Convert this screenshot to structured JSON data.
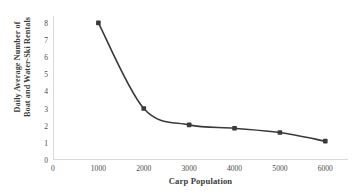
{
  "chart_data": {
    "type": "line",
    "title": "",
    "xlabel": "Carp Population",
    "ylabel": "Daily Average Number of Boat and Water-Ski Rentals",
    "ylabel_line1": "Daily Average Number of",
    "ylabel_line2": "Boat and Water-Ski Rentals",
    "x": [
      1000,
      2000,
      3000,
      4000,
      5000,
      6000
    ],
    "values": [
      8.0,
      3.0,
      2.05,
      1.85,
      1.6,
      1.1
    ],
    "xlim": [
      0,
      6500
    ],
    "ylim": [
      0,
      8.4
    ],
    "xticks": [
      0,
      1000,
      2000,
      3000,
      4000,
      5000,
      6000
    ],
    "xtick_labels": [
      "0",
      "1000",
      "2000",
      "3000",
      "4000",
      "5000",
      "6000"
    ],
    "yticks": [
      0,
      1,
      2,
      3,
      4,
      5,
      6,
      7,
      8
    ],
    "ytick_labels": [
      "0",
      "1",
      "2",
      "3",
      "4",
      "5",
      "6",
      "7",
      "8"
    ],
    "grid": false,
    "legend": false,
    "smooth": true,
    "marker": "square",
    "series_color": "#3a3a3a",
    "axis_color": "#d9d9d9",
    "text_color": "#3b3b3b",
    "background": "#ffffff"
  }
}
